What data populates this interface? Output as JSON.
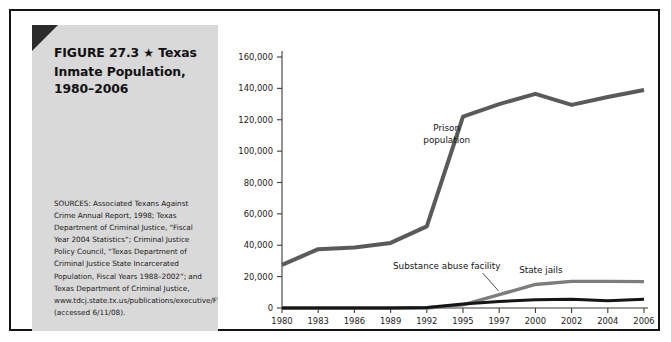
{
  "figure": {
    "title_line1": "FIGURE 27.3",
    "title_star": "★",
    "title_line1_rest": "Texas",
    "title_line2": "Inmate Population,",
    "title_line3": "1980–2006",
    "sources": "SOURCES: Associated Texans Against Crime Annual Report, 1998; Texas Department of Criminal Justice, “Fiscal Year 2004 Statistics”; Criminal Justice Policy Council, “Texas Department of Criminal Justice State Incarcerated Population, Fiscal Years 1988–2002”; and Texas Department of Criminal Justice, www.tdcj.state.tx.us/publications/executive/FY_2006_Statistical_Report.pdf (accessed 6/11/08).",
    "frame_color": "#141414",
    "panel_color": "#d9d9d9",
    "wedge_color": "#2b2b2b"
  },
  "chart_data": {
    "type": "line",
    "title": "Texas Inmate Population, 1980–2006",
    "xlabel": "",
    "ylabel": "",
    "categories": [
      "1980",
      "1983",
      "1986",
      "1989",
      "1992",
      "1995",
      "1997",
      "2000",
      "2002",
      "2004",
      "2006"
    ],
    "ylim": [
      0,
      160000
    ],
    "yticks": [
      0,
      20000,
      40000,
      60000,
      80000,
      100000,
      120000,
      140000,
      160000
    ],
    "ytick_labels": [
      "0",
      "20,000",
      "40,000",
      "60,000",
      "80,000",
      "100,000",
      "120,000",
      "140,000",
      "160,000"
    ],
    "grid": false,
    "legend": "inline-annotations",
    "series": [
      {
        "name": "Prison population",
        "color": "#5a5a5a",
        "width": 4.0,
        "values": [
          27500,
          37500,
          38500,
          41500,
          52000,
          122000,
          130000,
          136500,
          129500,
          134500,
          139000
        ],
        "label": "Prison population",
        "label_x": 0.455,
        "label_y": 0.295
      },
      {
        "name": "State jails",
        "color": "#7d7d7d",
        "width": 3.4,
        "values": [
          0,
          0,
          0,
          0,
          0,
          2000,
          8500,
          15000,
          17000,
          17000,
          16800
        ],
        "label": "State jails",
        "label_x": 0.715,
        "label_y": 0.862
      },
      {
        "name": "Substance abuse facility",
        "color": "#151515",
        "width": 3.0,
        "values": [
          0,
          0,
          0,
          0,
          300,
          2500,
          4200,
          5200,
          5600,
          4600,
          5600
        ],
        "label": "Substance abuse facility",
        "label_x": 0.455,
        "label_y": 0.845
      }
    ]
  }
}
